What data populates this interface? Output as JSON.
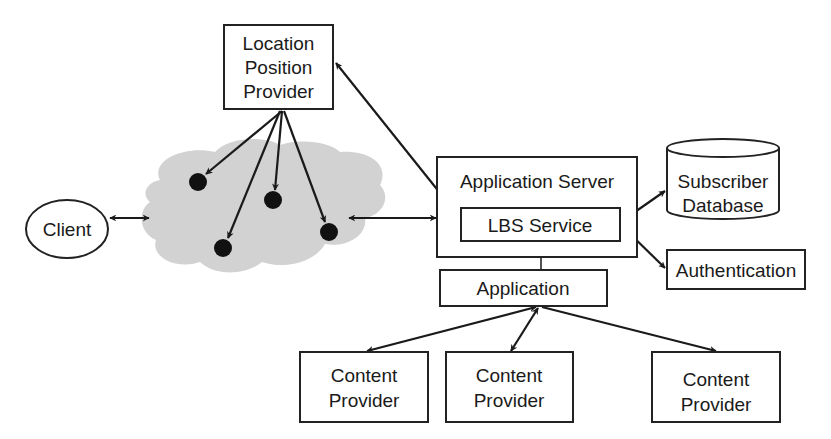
{
  "diagram": {
    "type": "architecture",
    "colors": {
      "stroke": "#1a1a1a",
      "cloud_fill": "#d2d2d2",
      "node_dot": "#111111",
      "background": "#ffffff"
    },
    "nodes": {
      "location_position_provider": {
        "lines": [
          "Location",
          "Position",
          "Provider"
        ]
      },
      "client": {
        "label": "Client"
      },
      "network_cloud": {
        "label": "",
        "device_count": 5
      },
      "application_server": {
        "label": "Application Server"
      },
      "lbs_service": {
        "label": "LBS Service"
      },
      "application": {
        "label": "Application"
      },
      "subscriber_database": {
        "lines": [
          "Subscriber",
          "Database"
        ]
      },
      "authentication": {
        "label": "Authentication"
      },
      "content_provider_1": {
        "lines": [
          "Content",
          "Provider"
        ]
      },
      "content_provider_2": {
        "lines": [
          "Content",
          "Provider"
        ]
      },
      "content_provider_3": {
        "lines": [
          "Content",
          "Provider"
        ]
      }
    },
    "edges": [
      {
        "from": "client",
        "to": "network_cloud",
        "direction": "both"
      },
      {
        "from": "network_cloud",
        "to": "application_server",
        "direction": "both"
      },
      {
        "from": "location_position_provider",
        "to": "lbs_service",
        "direction": "both"
      },
      {
        "from": "location_position_provider",
        "to": "network_cloud.device_1",
        "direction": "forward"
      },
      {
        "from": "location_position_provider",
        "to": "network_cloud.device_2",
        "direction": "forward"
      },
      {
        "from": "location_position_provider",
        "to": "network_cloud.device_3",
        "direction": "forward"
      },
      {
        "from": "location_position_provider",
        "to": "network_cloud.device_4",
        "direction": "forward"
      },
      {
        "from": "lbs_service",
        "to": "subscriber_database",
        "direction": "both"
      },
      {
        "from": "lbs_service",
        "to": "authentication",
        "direction": "both"
      },
      {
        "from": "application_server",
        "to": "application",
        "direction": "none"
      },
      {
        "from": "application",
        "to": "content_provider_1",
        "direction": "both"
      },
      {
        "from": "application",
        "to": "content_provider_2",
        "direction": "both"
      },
      {
        "from": "application",
        "to": "content_provider_3",
        "direction": "both"
      }
    ]
  }
}
